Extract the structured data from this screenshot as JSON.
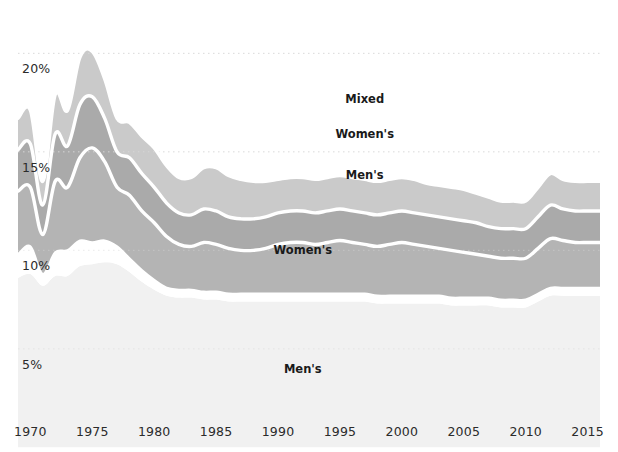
{
  "chart_data": {
    "type": "area",
    "title": "",
    "subtitle": "",
    "xlabel": "",
    "ylabel": "",
    "stacked": true,
    "grid": true,
    "grid_style": "dotted-horizontal",
    "legend_position": "inline-labels",
    "xlim": [
      1969,
      2016
    ],
    "ylim": [
      2.2,
      22.2
    ],
    "xticks": [
      1970,
      1975,
      1980,
      1985,
      1990,
      1995,
      2000,
      2005,
      2010,
      2015
    ],
    "xtick_labels": [
      "1970",
      "1975",
      "1980",
      "1985",
      "1990",
      "1995",
      "2000",
      "2005",
      "2010",
      "2015"
    ],
    "yticks": [
      5,
      10,
      15,
      20
    ],
    "ytick_labels": [
      "5%",
      "10%",
      "15%",
      "20%"
    ],
    "x": [
      1969,
      1970,
      1971,
      1972,
      1973,
      1974,
      1975,
      1976,
      1977,
      1978,
      1979,
      1980,
      1981,
      1982,
      1983,
      1984,
      1985,
      1986,
      1987,
      1988,
      1989,
      1990,
      1991,
      1992,
      1993,
      1994,
      1995,
      1996,
      1997,
      1998,
      1999,
      2000,
      2001,
      2002,
      2003,
      2004,
      2005,
      2006,
      2007,
      2008,
      2009,
      2010,
      2011,
      2012,
      2013,
      2014,
      2015,
      2016
    ],
    "series": [
      {
        "name": "Men's",
        "label": "Men's",
        "color": "#f1f1f1",
        "stack_order": 1,
        "label_x": 1992,
        "label_y": 4.0,
        "values": [
          8.6,
          8.8,
          8.2,
          8.7,
          8.7,
          9.2,
          9.3,
          9.4,
          9.3,
          8.9,
          8.4,
          8.0,
          7.7,
          7.6,
          7.6,
          7.5,
          7.5,
          7.4,
          7.4,
          7.4,
          7.4,
          7.4,
          7.4,
          7.4,
          7.4,
          7.4,
          7.4,
          7.4,
          7.4,
          7.3,
          7.3,
          7.3,
          7.3,
          7.3,
          7.3,
          7.2,
          7.2,
          7.2,
          7.2,
          7.1,
          7.1,
          7.1,
          7.4,
          7.7,
          7.7,
          7.7,
          7.7,
          7.7
        ]
      },
      {
        "name": "Women's",
        "label": "Women's",
        "color": "#ffffff",
        "stack_order": 2,
        "label_x": 1992,
        "label_y": 10.0,
        "values": [
          1.2,
          1.4,
          0.6,
          1.2,
          1.3,
          1.3,
          1.1,
          1.1,
          0.9,
          0.7,
          0.6,
          0.5,
          0.4,
          0.4,
          0.4,
          0.4,
          0.4,
          0.4,
          0.4,
          0.4,
          0.4,
          0.4,
          0.4,
          0.4,
          0.4,
          0.4,
          0.4,
          0.4,
          0.4,
          0.4,
          0.4,
          0.4,
          0.4,
          0.4,
          0.4,
          0.4,
          0.4,
          0.4,
          0.4,
          0.4,
          0.4,
          0.4,
          0.4,
          0.4,
          0.4,
          0.4,
          0.4,
          0.4
        ]
      },
      {
        "name": "Men's",
        "label": "Men's",
        "color": "#b4b4b4",
        "stack_order": 3,
        "label_x": 1997,
        "label_y": 13.8,
        "values": [
          3.2,
          3.0,
          2.0,
          3.6,
          3.2,
          4.2,
          4.8,
          4.0,
          3.0,
          3.2,
          3.0,
          2.9,
          2.6,
          2.3,
          2.2,
          2.5,
          2.4,
          2.3,
          2.2,
          2.2,
          2.3,
          2.5,
          2.6,
          2.6,
          2.5,
          2.6,
          2.7,
          2.6,
          2.5,
          2.5,
          2.6,
          2.7,
          2.6,
          2.5,
          2.4,
          2.4,
          2.3,
          2.2,
          2.1,
          2.1,
          2.1,
          2.1,
          2.3,
          2.5,
          2.4,
          2.3,
          2.3,
          2.3
        ]
      },
      {
        "name": "Women's",
        "label": "Women's",
        "color": "#aaaaaa",
        "stack_order": 4,
        "label_x": 1997,
        "label_y": 15.9,
        "values": [
          2.1,
          2.2,
          1.5,
          2.4,
          2.1,
          2.7,
          2.6,
          2.2,
          1.8,
          1.9,
          1.9,
          1.8,
          1.7,
          1.6,
          1.6,
          1.7,
          1.7,
          1.6,
          1.6,
          1.6,
          1.6,
          1.6,
          1.6,
          1.6,
          1.6,
          1.6,
          1.6,
          1.6,
          1.6,
          1.6,
          1.6,
          1.6,
          1.6,
          1.6,
          1.6,
          1.6,
          1.6,
          1.6,
          1.5,
          1.5,
          1.5,
          1.5,
          1.6,
          1.7,
          1.6,
          1.6,
          1.6,
          1.6
        ]
      },
      {
        "name": "Mixed",
        "label": "Mixed",
        "color": "#cacaca",
        "stack_order": 5,
        "label_x": 1997,
        "label_y": 17.7,
        "values": [
          1.6,
          1.7,
          1.2,
          2.0,
          1.8,
          2.4,
          2.3,
          2.0,
          1.7,
          1.8,
          1.9,
          2.0,
          1.9,
          1.8,
          1.9,
          2.1,
          2.2,
          2.1,
          2.0,
          1.9,
          1.8,
          1.7,
          1.7,
          1.7,
          1.7,
          1.7,
          1.7,
          1.7,
          1.7,
          1.7,
          1.7,
          1.7,
          1.7,
          1.6,
          1.6,
          1.6,
          1.6,
          1.5,
          1.5,
          1.4,
          1.4,
          1.4,
          1.5,
          1.6,
          1.5,
          1.5,
          1.5,
          1.5
        ]
      }
    ],
    "annotations": [
      {
        "text": "Mixed",
        "x": 1997,
        "y": 17.7
      },
      {
        "text": "Women's",
        "x": 1997,
        "y": 15.9
      },
      {
        "text": "Men's",
        "x": 1997,
        "y": 13.8
      },
      {
        "text": "Women's",
        "x": 1992,
        "y": 10.0
      },
      {
        "text": "Men's",
        "x": 1992,
        "y": 4.0
      }
    ],
    "colors": {
      "background": "#ffffff",
      "grid": "#d8d8d8",
      "separator": "#ffffff",
      "text": "#2b2b2b"
    }
  }
}
